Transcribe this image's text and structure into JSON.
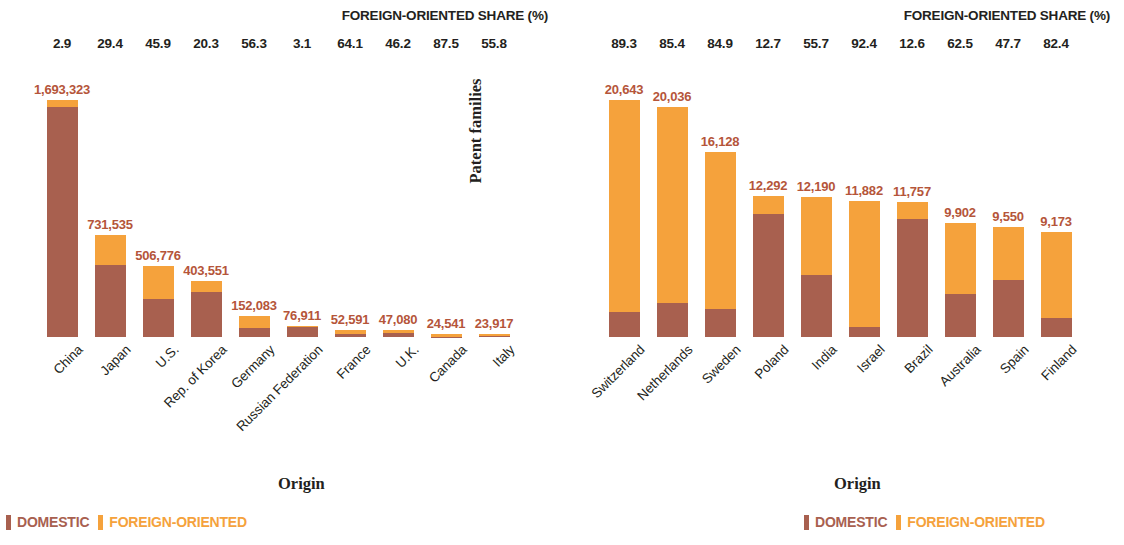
{
  "colors": {
    "domestic": "#A8604F",
    "foreign": "#F5A23C",
    "value_text": "#B5553A",
    "axis_text": "#231f20"
  },
  "panels": [
    {
      "id": "left",
      "share_title": "FOREIGN-ORIENTED SHARE (%)",
      "ylabel": "Patent families",
      "xlabel": "Origin",
      "legend": [
        {
          "label": "DOMESTIC",
          "color": "#A8604F"
        },
        {
          "label": "FOREIGN-ORIENTED",
          "color": "#F5A23C"
        }
      ],
      "categories": [
        "China",
        "Japan",
        "U.S.",
        "Rep. of Korea",
        "Germany",
        "Russian Federation",
        "France",
        "U.K.",
        "Canada",
        "Italy"
      ],
      "values": [
        1693323,
        731535,
        506776,
        403551,
        152083,
        76911,
        52591,
        47080,
        24541,
        23917
      ],
      "value_labels": [
        "1,693,323",
        "731,535",
        "506,776",
        "403,551",
        "152,083",
        "76,911",
        "52,591",
        "47,080",
        "24,541",
        "23,917"
      ],
      "foreign_share": [
        2.9,
        29.4,
        45.9,
        20.3,
        56.3,
        3.1,
        64.1,
        46.2,
        87.5,
        55.8
      ],
      "share_labels": [
        "2.9",
        "29.4",
        "45.9",
        "20.3",
        "56.3",
        "3.1",
        "64.1",
        "46.2",
        "87.5",
        "55.8"
      ]
    },
    {
      "id": "right",
      "share_title": "FOREIGN-ORIENTED SHARE (%)",
      "ylabel": "Patent families",
      "xlabel": "Origin",
      "legend": [
        {
          "label": "DOMESTIC",
          "color": "#A8604F"
        },
        {
          "label": "FOREIGN-ORIENTED",
          "color": "#F5A23C"
        }
      ],
      "categories": [
        "Switzerland",
        "Netherlands",
        "Sweden",
        "Poland",
        "India",
        "Israel",
        "Brazil",
        "Australia",
        "Spain",
        "Finland"
      ],
      "values": [
        20643,
        20036,
        16128,
        12292,
        12190,
        11882,
        11757,
        9902,
        9550,
        9173
      ],
      "value_labels": [
        "20,643",
        "20,036",
        "16,128",
        "12,292",
        "12,190",
        "11,882",
        "11,757",
        "9,902",
        "9,550",
        "9,173"
      ],
      "foreign_share": [
        89.3,
        85.4,
        84.9,
        12.7,
        55.7,
        92.4,
        12.6,
        62.5,
        47.7,
        82.4
      ],
      "share_labels": [
        "89.3",
        "85.4",
        "84.9",
        "12.7",
        "55.7",
        "92.4",
        "12.6",
        "62.5",
        "47.7",
        "82.4"
      ]
    }
  ],
  "chart_data": {
    "type": "bar",
    "xlabel": "Origin",
    "ylabel": "Patent families",
    "stacked": true,
    "grid": false,
    "legend": [
      "DOMESTIC",
      "FOREIGN-ORIENTED"
    ],
    "legend_position": "bottom-left",
    "panels": [
      {
        "name": "Top 10 origins",
        "secondary_axis_label": "FOREIGN-ORIENTED SHARE (%)",
        "categories": [
          "China",
          "Japan",
          "U.S.",
          "Rep. of Korea",
          "Germany",
          "Russian Federation",
          "France",
          "U.K.",
          "Canada",
          "Italy"
        ],
        "totals": [
          1693323,
          731535,
          506776,
          403551,
          152083,
          76911,
          52591,
          47080,
          24541,
          23917
        ],
        "foreign_share_pct": [
          2.9,
          29.4,
          45.9,
          20.3,
          56.3,
          3.1,
          64.1,
          46.2,
          87.5,
          55.8
        ],
        "series": [
          {
            "name": "DOMESTIC",
            "values": [
              1644217,
              516464,
              274167,
              321630,
              66460,
              74527,
              18880,
              25329,
              3068,
              10571
            ]
          },
          {
            "name": "FOREIGN-ORIENTED",
            "values": [
              49106,
              215071,
              232609,
              81921,
              85623,
              2384,
              33711,
              21751,
              21473,
              13346
            ]
          }
        ],
        "ylim": [
          0,
          1693323
        ]
      },
      {
        "name": "Origins ranked 11-20",
        "secondary_axis_label": "FOREIGN-ORIENTED SHARE (%)",
        "categories": [
          "Switzerland",
          "Netherlands",
          "Sweden",
          "Poland",
          "India",
          "Israel",
          "Brazil",
          "Australia",
          "Spain",
          "Finland"
        ],
        "totals": [
          20643,
          20036,
          16128,
          12292,
          12190,
          11882,
          11757,
          9902,
          9550,
          9173
        ],
        "foreign_share_pct": [
          89.3,
          85.4,
          84.9,
          12.7,
          55.7,
          92.4,
          12.6,
          62.5,
          47.7,
          82.4
        ],
        "series": [
          {
            "name": "DOMESTIC",
            "values": [
              2209,
              2925,
              2435,
              10731,
              5400,
              903,
              10276,
              3713,
              4995,
              1614
            ]
          },
          {
            "name": "FOREIGN-ORIENTED",
            "values": [
              18434,
              17111,
              13693,
              1561,
              6790,
              10979,
              1481,
              6189,
              4555,
              7559
            ]
          }
        ],
        "ylim": [
          0,
          20643
        ]
      }
    ]
  }
}
